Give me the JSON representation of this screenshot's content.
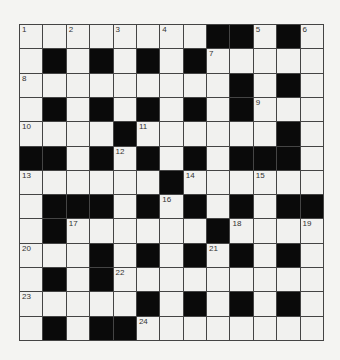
{
  "puzzle": {
    "rows": 13,
    "cols": 13,
    "colors": {
      "background": "#f4f4f2",
      "white_cell": "#f1f1ef",
      "black_cell": "#0a0a0a",
      "grid_line": "#444444"
    },
    "grid": [
      "WWWWWWWWBBWBW",
      "WBWBWBWBWWWWW",
      "WWWWWWWWWBWBW",
      "WBWBWBWBWBWWW",
      "WWWWBWWWWWWBW",
      "BBWBWBWBWBBBW",
      "WWWWWWBWWWWWW",
      "WBBBWBWBWBWBB",
      "WBWWWWWWBWWWW",
      "WWWBWBWBWBWBW",
      "WBWBWWWWWWWWW",
      "WWWWWBWBWBWBW",
      "WBWBBWWWWWWWW"
    ],
    "numbers": [
      {
        "row": 0,
        "col": 0,
        "n": "1"
      },
      {
        "row": 0,
        "col": 2,
        "n": "2"
      },
      {
        "row": 0,
        "col": 4,
        "n": "3"
      },
      {
        "row": 0,
        "col": 6,
        "n": "4"
      },
      {
        "row": 0,
        "col": 10,
        "n": "5"
      },
      {
        "row": 0,
        "col": 12,
        "n": "6"
      },
      {
        "row": 1,
        "col": 8,
        "n": "7"
      },
      {
        "row": 2,
        "col": 0,
        "n": "8"
      },
      {
        "row": 3,
        "col": 10,
        "n": "9"
      },
      {
        "row": 4,
        "col": 0,
        "n": "10"
      },
      {
        "row": 4,
        "col": 5,
        "n": "11"
      },
      {
        "row": 5,
        "col": 4,
        "n": "12"
      },
      {
        "row": 6,
        "col": 0,
        "n": "13"
      },
      {
        "row": 6,
        "col": 7,
        "n": "14"
      },
      {
        "row": 6,
        "col": 10,
        "n": "15"
      },
      {
        "row": 7,
        "col": 6,
        "n": "16"
      },
      {
        "row": 8,
        "col": 2,
        "n": "17"
      },
      {
        "row": 8,
        "col": 9,
        "n": "18"
      },
      {
        "row": 8,
        "col": 12,
        "n": "19"
      },
      {
        "row": 9,
        "col": 0,
        "n": "20"
      },
      {
        "row": 9,
        "col": 8,
        "n": "21"
      },
      {
        "row": 10,
        "col": 4,
        "n": "22"
      },
      {
        "row": 11,
        "col": 0,
        "n": "23"
      },
      {
        "row": 12,
        "col": 5,
        "n": "24"
      }
    ]
  }
}
